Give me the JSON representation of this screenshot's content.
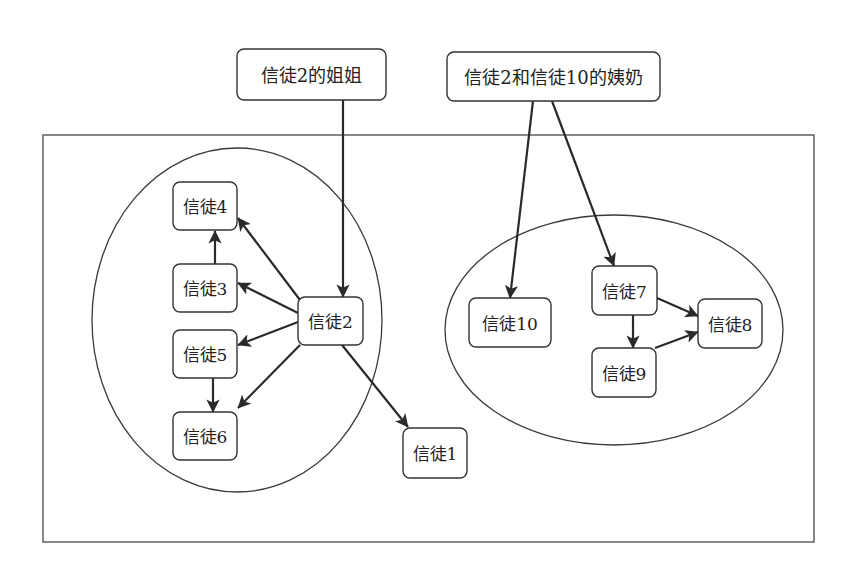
{
  "diagram": {
    "type": "community-relationship-graph",
    "frame": {
      "x": 43,
      "y": 135,
      "width": 771,
      "height": 407
    },
    "colors": {
      "stroke": "#333333",
      "edge": "#2a2a2a",
      "background": "#ffffff",
      "text": "#222222"
    },
    "external_nodes": [
      {
        "id": "sister",
        "label": "信徒2的姐姐",
        "x": 237,
        "y": 49,
        "w": 149,
        "h": 51
      },
      {
        "id": "aunt",
        "label": "信徒2和信徒10的姨奶",
        "x": 447,
        "y": 52,
        "w": 213,
        "h": 49
      }
    ],
    "groups": [
      {
        "id": "group-left",
        "cx": 237,
        "cy": 320,
        "rx": 145,
        "ry": 172
      },
      {
        "id": "group-right",
        "cx": 614,
        "cy": 330,
        "rx": 169,
        "ry": 115
      }
    ],
    "nodes": [
      {
        "id": "b4",
        "label": "信徒4",
        "x": 173,
        "y": 182,
        "w": 64,
        "h": 48
      },
      {
        "id": "b3",
        "label": "信徒3",
        "x": 173,
        "y": 264,
        "w": 64,
        "h": 48
      },
      {
        "id": "b5",
        "label": "信徒5",
        "x": 173,
        "y": 330,
        "w": 64,
        "h": 48
      },
      {
        "id": "b6",
        "label": "信徒6",
        "x": 173,
        "y": 412,
        "w": 64,
        "h": 48
      },
      {
        "id": "b2",
        "label": "信徒2",
        "x": 298,
        "y": 297,
        "w": 65,
        "h": 48
      },
      {
        "id": "b1",
        "label": "信徒1",
        "x": 403,
        "y": 428,
        "w": 64,
        "h": 50
      },
      {
        "id": "b10",
        "label": "信徒10",
        "x": 469,
        "y": 298,
        "w": 82,
        "h": 49
      },
      {
        "id": "b7",
        "label": "信徒7",
        "x": 592,
        "y": 266,
        "w": 65,
        "h": 49
      },
      {
        "id": "b9",
        "label": "信徒9",
        "x": 592,
        "y": 348,
        "w": 64,
        "h": 49
      },
      {
        "id": "b8",
        "label": "信徒8",
        "x": 698,
        "y": 299,
        "w": 64,
        "h": 49
      }
    ],
    "edges": [
      {
        "from": "信徒2的姐姐",
        "to": "信徒2",
        "x1": 343,
        "y1": 100,
        "x2": 343,
        "y2": 297
      },
      {
        "from": "信徒2和信徒10的姨奶",
        "to": "信徒10",
        "x1": 533,
        "y1": 101,
        "x2": 510,
        "y2": 298
      },
      {
        "from": "信徒2和信徒10的姨奶",
        "to": "信徒7",
        "x1": 552,
        "y1": 101,
        "x2": 614,
        "y2": 266
      },
      {
        "from": "信徒2",
        "to": "信徒4",
        "x1": 300,
        "y1": 300,
        "x2": 238,
        "y2": 218
      },
      {
        "from": "信徒2",
        "to": "信徒3",
        "x1": 298,
        "y1": 313,
        "x2": 238,
        "y2": 283
      },
      {
        "from": "信徒2",
        "to": "信徒5",
        "x1": 298,
        "y1": 322,
        "x2": 238,
        "y2": 345
      },
      {
        "from": "信徒2",
        "to": "信徒6",
        "x1": 300,
        "y1": 345,
        "x2": 238,
        "y2": 408
      },
      {
        "from": "信徒2",
        "to": "信徒1",
        "x1": 342,
        "y1": 345,
        "x2": 408,
        "y2": 427
      },
      {
        "from": "信徒3",
        "to": "信徒4",
        "x1": 215,
        "y1": 264,
        "x2": 215,
        "y2": 231
      },
      {
        "from": "信徒5",
        "to": "信徒6",
        "x1": 213,
        "y1": 378,
        "x2": 213,
        "y2": 412
      },
      {
        "from": "信徒7",
        "to": "信徒9",
        "x1": 633,
        "y1": 315,
        "x2": 633,
        "y2": 348
      },
      {
        "from": "信徒7",
        "to": "信徒8",
        "x1": 657,
        "y1": 298,
        "x2": 698,
        "y2": 316
      },
      {
        "from": "信徒9",
        "to": "信徒8",
        "x1": 655,
        "y1": 348,
        "x2": 698,
        "y2": 332
      }
    ]
  }
}
